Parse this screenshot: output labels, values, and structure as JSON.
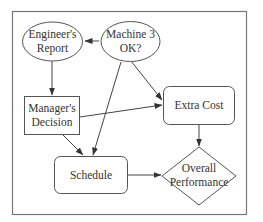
{
  "diagram": {
    "type": "influence-diagram",
    "nodes": [
      {
        "id": "engineers-report",
        "shape": "ellipse",
        "lines": [
          "Engineer's",
          "Report"
        ]
      },
      {
        "id": "machine-3-ok",
        "shape": "ellipse",
        "lines": [
          "Machine 3",
          "OK?"
        ]
      },
      {
        "id": "managers-decision",
        "shape": "rectangle",
        "lines": [
          "Manager's",
          "Decision"
        ]
      },
      {
        "id": "extra-cost",
        "shape": "rounded-rectangle",
        "lines": [
          "Extra Cost"
        ]
      },
      {
        "id": "schedule",
        "shape": "rounded-rectangle",
        "lines": [
          "Schedule"
        ]
      },
      {
        "id": "overall-performance",
        "shape": "diamond",
        "lines": [
          "Overall",
          "Performance"
        ]
      }
    ],
    "edges": [
      {
        "from": "machine-3-ok",
        "to": "engineers-report"
      },
      {
        "from": "engineers-report",
        "to": "managers-decision"
      },
      {
        "from": "machine-3-ok",
        "to": "extra-cost"
      },
      {
        "from": "machine-3-ok",
        "to": "schedule"
      },
      {
        "from": "managers-decision",
        "to": "extra-cost"
      },
      {
        "from": "managers-decision",
        "to": "schedule"
      },
      {
        "from": "extra-cost",
        "to": "overall-performance"
      },
      {
        "from": "schedule",
        "to": "overall-performance"
      }
    ]
  },
  "labels": {
    "engineers_report": {
      "line1": "Engineer's",
      "line2": "Report"
    },
    "machine_3_ok": {
      "line1": "Machine 3",
      "line2": "OK?"
    },
    "managers_decision": {
      "line1": "Manager's",
      "line2": "Decision"
    },
    "extra_cost": {
      "line1": "Extra Cost"
    },
    "schedule": {
      "line1": "Schedule"
    },
    "overall_performance": {
      "line1": "Overall",
      "line2": "Performance"
    }
  }
}
